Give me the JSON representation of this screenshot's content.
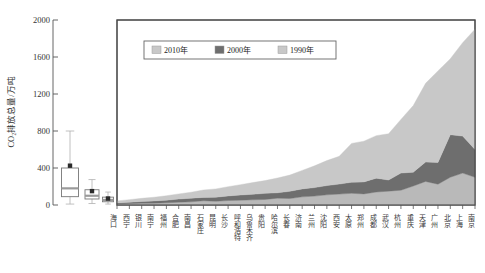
{
  "chart_data": {
    "type": "area",
    "title": "",
    "xlabel": "",
    "ylabel": "CO₂排放总量/万吨",
    "ylim": [
      0,
      2000
    ],
    "yticks": [
      0,
      400,
      800,
      1200,
      1600,
      2000
    ],
    "ytick_labels": [
      "0",
      "400",
      "800",
      "1200",
      "1600",
      "2000"
    ],
    "grid": false,
    "legend_position": "top-center",
    "stacked": true,
    "categories": [
      "海口",
      "西宁",
      "银川",
      "南宁",
      "福州",
      "合肥",
      "南昌",
      "石家庄",
      "昆明",
      "长沙",
      "呼和浩特",
      "乌鲁木齐",
      "贵阳",
      "哈尔滨",
      "长春",
      "济南",
      "兰州",
      "沈阳",
      "西安",
      "太原",
      "郑州",
      "成都",
      "武汉",
      "杭州",
      "重庆",
      "天津",
      "广州",
      "北京",
      "上海",
      "南京"
    ],
    "series": [
      {
        "name": "1990年",
        "color": "#b9b9b9",
        "values": [
          10,
          14,
          18,
          20,
          24,
          30,
          34,
          46,
          40,
          48,
          52,
          56,
          60,
          74,
          70,
          88,
          96,
          110,
          118,
          126,
          120,
          140,
          150,
          160,
          205,
          255,
          225,
          300,
          345,
          300
        ]
      },
      {
        "name": "2000年",
        "color": "#6e6e6e",
        "values": [
          12,
          16,
          20,
          24,
          28,
          34,
          40,
          36,
          44,
          50,
          56,
          60,
          66,
          58,
          78,
          86,
          92,
          100,
          108,
          120,
          130,
          150,
          120,
          185,
          150,
          210,
          235,
          460,
          400,
          300
        ]
      },
      {
        "name": "2010年",
        "color": "#c8c8c8",
        "values": [
          22,
          28,
          34,
          40,
          48,
          56,
          64,
          80,
          90,
          100,
          112,
          126,
          138,
          160,
          175,
          200,
          235,
          270,
          300,
          420,
          440,
          460,
          500,
          580,
          720,
          850,
          990,
          820,
          1010,
          1300
        ]
      }
    ],
    "boxplots": [
      {
        "label": "1990年",
        "position": 1,
        "min": 10,
        "q1": 90,
        "median": 180,
        "q3": 400,
        "max": 800,
        "mean": 425
      },
      {
        "label": "2000年",
        "position": 2,
        "min": 16,
        "q1": 65,
        "median": 100,
        "q3": 165,
        "max": 275,
        "mean": 150
      },
      {
        "label": "2010年",
        "position": 3,
        "min": 10,
        "q1": 35,
        "median": 55,
        "q3": 85,
        "max": 140,
        "mean": 70
      }
    ]
  },
  "legend": {
    "items": [
      {
        "label": "2010年",
        "color": "#c8c8c8"
      },
      {
        "label": "2000年",
        "color": "#6e6e6e"
      },
      {
        "label": "1990年",
        "color": "#c8c8c8"
      }
    ]
  }
}
